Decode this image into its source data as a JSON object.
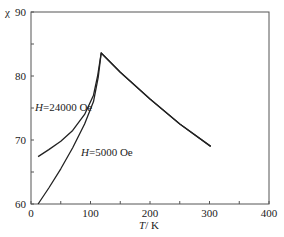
{
  "chart_data": {
    "type": "line",
    "title": "",
    "xlabel": "T/ K",
    "ylabel": "χ",
    "xlim": [
      0,
      400
    ],
    "ylim": [
      60,
      90
    ],
    "xticks": [
      0,
      100,
      200,
      300,
      400
    ],
    "yticks": [
      60,
      70,
      80,
      90
    ],
    "grid": false,
    "legend": "none (inline annotations)",
    "series": [
      {
        "name": "H=24000 Oe",
        "x": [
          12,
          30,
          50,
          70,
          90,
          105,
          112,
          118,
          150,
          200,
          250,
          302
        ],
        "y": [
          67.4,
          68.5,
          69.8,
          71.5,
          74.0,
          77.0,
          80.0,
          83.6,
          80.6,
          76.4,
          72.5,
          69.0
        ]
      },
      {
        "name": "H=5000 Oe",
        "x": [
          12,
          30,
          50,
          70,
          90,
          105,
          113,
          118,
          150,
          200,
          250,
          302
        ],
        "y": [
          60.0,
          62.5,
          65.5,
          68.8,
          72.5,
          76.0,
          79.8,
          83.6,
          80.6,
          76.4,
          72.5,
          69.0
        ]
      }
    ],
    "annotations": [
      {
        "text_italic": "H",
        "text": "=24000 Oe",
        "near_series": "H=24000 Oe"
      },
      {
        "text_italic": "H",
        "text": "=5000 Oe",
        "near_series": "H=5000 Oe"
      }
    ]
  },
  "labels": {
    "y_axis_symbol": "χ",
    "y_top": "90",
    "x_title_italic": "T",
    "x_title_rest": "/ K",
    "ann1_italic": "H",
    "ann1_rest": "=24000 Oe",
    "ann2_italic": "H",
    "ann2_rest": "=5000 Oe"
  }
}
